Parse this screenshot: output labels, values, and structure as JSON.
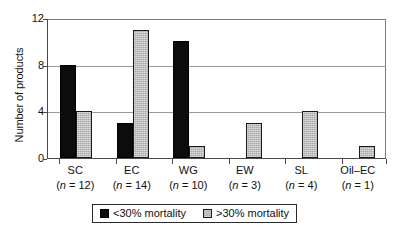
{
  "chart_data": {
    "type": "bar",
    "title": "",
    "xlabel": "",
    "ylabel": "Number of products",
    "ylim": [
      0,
      12
    ],
    "yticks": [
      0,
      4,
      8,
      12
    ],
    "ytick_labels": [
      "0",
      "4",
      "8",
      "12"
    ],
    "grid": "horizontal",
    "legend_position": "bottom-center",
    "categories": [
      "SC",
      "EC",
      "WG",
      "EW",
      "SL",
      "Oil–EC"
    ],
    "category_counts": [
      "(n = 12)",
      "(n = 14)",
      "(n = 10)",
      "(n = 3)",
      "(n = 4)",
      "(n = 1)"
    ],
    "category_n_values": [
      12,
      14,
      10,
      3,
      4,
      1
    ],
    "series": [
      {
        "name": "<30% mortality",
        "color": "#0c0c0c",
        "values": [
          8,
          3,
          10,
          0,
          0,
          0
        ]
      },
      {
        "name": ">30% mortality",
        "color": "#b9b9b9",
        "values": [
          4,
          11,
          1,
          3,
          4,
          1
        ]
      }
    ]
  },
  "axes": {
    "y_title": "Number of products"
  },
  "legend": {
    "entries": [
      {
        "label": "<30% mortality",
        "swatch": "dark"
      },
      {
        "label": ">30% mortality",
        "swatch": "light"
      }
    ]
  }
}
